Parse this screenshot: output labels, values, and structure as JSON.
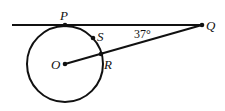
{
  "diagram": {
    "type": "geometry",
    "points": {
      "P": "P",
      "Q": "Q",
      "S": "S",
      "O": "O",
      "R": "R"
    },
    "angle_label": "37°",
    "colors": {
      "stroke": "#111111",
      "background": "#ffffff"
    }
  }
}
